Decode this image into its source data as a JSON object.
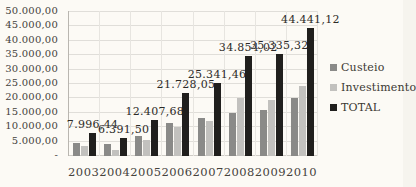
{
  "chart_data": {
    "type": "bar",
    "title": "",
    "xlabel": "",
    "ylabel": "",
    "categories": [
      "2003",
      "2004",
      "2005",
      "2006",
      "2007",
      "2008",
      "2009",
      "2010"
    ],
    "series": [
      {
        "name": "Custeio",
        "color": "#8a8a88",
        "values": [
          4600.0,
          4200.0,
          6900.0,
          11500.0,
          13200.0,
          14800.0,
          16000.0,
          20000.0
        ]
      },
      {
        "name": "Investimento",
        "color": "#c2c1be",
        "values": [
          3396.44,
          2191.5,
          5507.68,
          10228.05,
          12141.46,
          20054.02,
          19335.32,
          24441.12
        ]
      },
      {
        "name": "TOTAL",
        "color": "#201f1d",
        "values": [
          7996.44,
          6391.5,
          12407.68,
          21728.05,
          25341.46,
          34854.02,
          35335.32,
          44441.12
        ]
      }
    ],
    "data_labels": [
      "7.996,44",
      "6.391,50",
      "12.407,68",
      "21.728,05",
      "25.341,46",
      "34.854,02",
      "35.335,32",
      "44.441,12"
    ],
    "data_labels_series": "TOTAL",
    "y_tick_labels_top_to_bottom": [
      "50.000,00",
      "45.000,00",
      "40.000,00",
      "35.000,00",
      "30.000,00",
      "25.000,00",
      "20.000,00",
      "15.000,00",
      "10.000,00",
      "5.000,00",
      "-"
    ],
    "ylim": [
      0,
      50000
    ],
    "y_step": 5000,
    "grid": true,
    "legend_position": "right"
  },
  "colors": {
    "background": "#fcfaf5",
    "grid_horizontal": "#e0ded9",
    "grid_vertical": "#e7e5e0",
    "axis_line": "#b9b6b0",
    "text": "#3b3832"
  }
}
